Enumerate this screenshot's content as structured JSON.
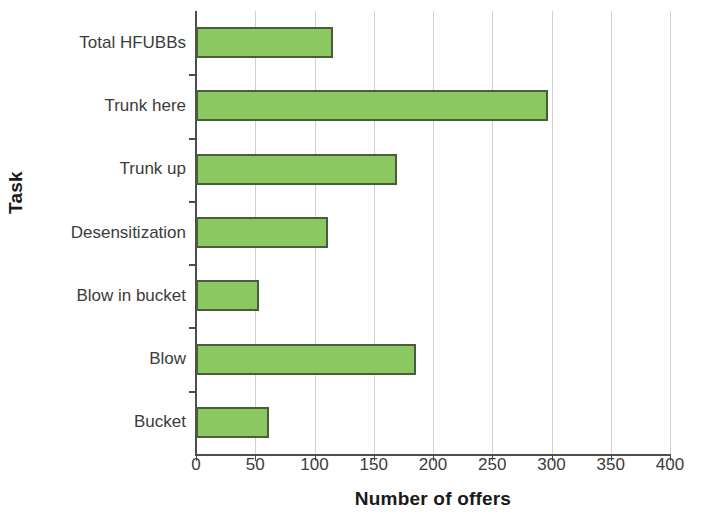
{
  "chart_data": {
    "type": "bar",
    "orientation": "horizontal",
    "title": "",
    "xlabel": "Number of offers",
    "ylabel": "Task",
    "categories": [
      "Bucket",
      "Blow",
      "Blow in bucket",
      "Desensitization",
      "Trunk up",
      "Trunk here",
      "Total HFUBBs"
    ],
    "values": [
      62,
      186,
      53,
      111,
      170,
      297,
      116
    ],
    "xlim": [
      0,
      400
    ],
    "xticks": [
      0,
      50,
      100,
      150,
      200,
      250,
      300,
      350,
      400
    ],
    "xtick_labels": [
      "0",
      "50",
      "100",
      "150",
      "200",
      "250",
      "300",
      "350",
      "400"
    ],
    "grid": "vertical",
    "legend": "none",
    "bar_fill_color": "#8cc861",
    "bar_edge_color": "#4a5c3a",
    "axis_color": "#4d4d4d",
    "gridline_color": "#cfcfcf",
    "background_color": "#ffffff"
  },
  "display_order": [
    {
      "label": "Total HFUBBs",
      "value": 116
    },
    {
      "label": "Trunk here",
      "value": 297
    },
    {
      "label": "Trunk up",
      "value": 170
    },
    {
      "label": "Desensitization",
      "value": 111
    },
    {
      "label": "Blow in bucket",
      "value": 53
    },
    {
      "label": "Blow",
      "value": 186
    },
    {
      "label": "Bucket",
      "value": 62
    }
  ]
}
